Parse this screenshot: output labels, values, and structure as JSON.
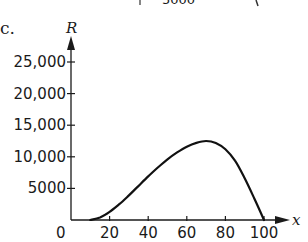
{
  "part_label": "c.",
  "top_fragment": {
    "text": "5000"
  },
  "chart_data": {
    "type": "line",
    "title": "",
    "xlabel": "x",
    "ylabel": "R",
    "xlim": [
      0,
      100
    ],
    "ylim": [
      0,
      27000
    ],
    "grid": false,
    "legend": null,
    "x_ticks": [
      20,
      40,
      60,
      80,
      100
    ],
    "x_tick_labels": [
      "20",
      "40",
      "60",
      "80",
      "100"
    ],
    "y_ticks": [
      5000,
      10000,
      15000,
      20000,
      25000
    ],
    "y_tick_labels": [
      "5000",
      "10,000",
      "15,000",
      "20,000",
      "25,000"
    ],
    "origin_label": "0",
    "series": [
      {
        "name": "R",
        "x": [
          10,
          15,
          20,
          25,
          30,
          35,
          40,
          45,
          50,
          55,
          60,
          65,
          70,
          75,
          80,
          85,
          90,
          95,
          100
        ],
        "y": [
          0,
          400,
          1300,
          2500,
          3900,
          5400,
          6900,
          8300,
          9600,
          10700,
          11600,
          12200,
          12500,
          12200,
          11200,
          9400,
          6600,
          3400,
          0
        ]
      }
    ]
  },
  "colors": {
    "line": "#111111",
    "background": "#ffffff"
  }
}
